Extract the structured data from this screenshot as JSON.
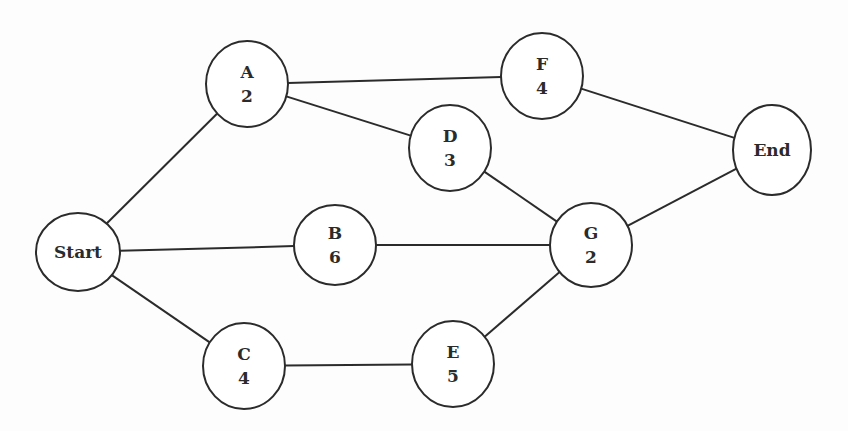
{
  "diagram": {
    "type": "activity-network",
    "nodes": [
      {
        "id": "Start",
        "name": "Start",
        "duration": null,
        "cx": 78,
        "cy": 252,
        "rx": 42,
        "ry": 39
      },
      {
        "id": "A",
        "name": "A",
        "duration": "2",
        "cx": 247,
        "cy": 84,
        "rx": 41,
        "ry": 43
      },
      {
        "id": "B",
        "name": "B",
        "duration": "6",
        "cx": 335,
        "cy": 245,
        "rx": 41,
        "ry": 40
      },
      {
        "id": "C",
        "name": "C",
        "duration": "4",
        "cx": 244,
        "cy": 366,
        "rx": 41,
        "ry": 43
      },
      {
        "id": "D",
        "name": "D",
        "duration": "3",
        "cx": 450,
        "cy": 148,
        "rx": 41,
        "ry": 43
      },
      {
        "id": "E",
        "name": "E",
        "duration": "5",
        "cx": 453,
        "cy": 364,
        "rx": 41,
        "ry": 43
      },
      {
        "id": "F",
        "name": "F",
        "duration": "4",
        "cx": 542,
        "cy": 76,
        "rx": 41,
        "ry": 43
      },
      {
        "id": "G",
        "name": "G",
        "duration": "2",
        "cx": 591,
        "cy": 245,
        "rx": 41,
        "ry": 42
      },
      {
        "id": "End",
        "name": "End",
        "duration": null,
        "cx": 772,
        "cy": 150,
        "rx": 39,
        "ry": 45
      }
    ],
    "edges": [
      {
        "from": "Start",
        "to": "A"
      },
      {
        "from": "Start",
        "to": "B"
      },
      {
        "from": "Start",
        "to": "C"
      },
      {
        "from": "A",
        "to": "F"
      },
      {
        "from": "A",
        "to": "D"
      },
      {
        "from": "D",
        "to": "G"
      },
      {
        "from": "B",
        "to": "G"
      },
      {
        "from": "C",
        "to": "E"
      },
      {
        "from": "E",
        "to": "G"
      },
      {
        "from": "F",
        "to": "End"
      },
      {
        "from": "G",
        "to": "End"
      }
    ],
    "colors": {
      "stroke": "#2b2b2b",
      "fill": "#ffffff",
      "text": "#2b2b2b"
    }
  },
  "labels": {
    "start": "Start",
    "end": "End",
    "A": {
      "name": "A",
      "duration": "2"
    },
    "B": {
      "name": "B",
      "duration": "6"
    },
    "C": {
      "name": "C",
      "duration": "4"
    },
    "D": {
      "name": "D",
      "duration": "3"
    },
    "E": {
      "name": "E",
      "duration": "5"
    },
    "F": {
      "name": "F",
      "duration": "4"
    },
    "G": {
      "name": "G",
      "duration": "2"
    }
  }
}
